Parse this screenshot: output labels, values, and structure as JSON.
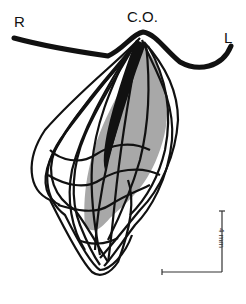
{
  "figure": {
    "labels": {
      "right": "R",
      "center": "C.O.",
      "left": "L"
    },
    "scale_bar": {
      "label": "4 mm",
      "orientation": "vertical with horizontal base"
    },
    "colors": {
      "line": "#111111",
      "shaded_region": "#a8a8a8",
      "background": "#ffffff"
    }
  }
}
